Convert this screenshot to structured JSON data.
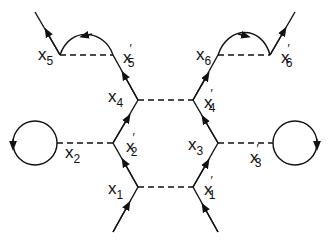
{
  "diagram": {
    "colors": {
      "stroke": "#111111",
      "background": "#ffffff"
    },
    "labels": {
      "x1": {
        "base": "x",
        "sub": "1",
        "prime": ""
      },
      "x1p": {
        "base": "x",
        "sub": "1",
        "prime": "′"
      },
      "x2": {
        "base": "x",
        "sub": "2",
        "prime": ""
      },
      "x2p": {
        "base": "x",
        "sub": "2",
        "prime": "′"
      },
      "x3": {
        "base": "x",
        "sub": "3",
        "prime": ""
      },
      "x3p": {
        "base": "x",
        "sub": "3",
        "prime": "′"
      },
      "x4": {
        "base": "x",
        "sub": "4",
        "prime": ""
      },
      "x4p": {
        "base": "x",
        "sub": "4",
        "prime": "′"
      },
      "x5": {
        "base": "x",
        "sub": "5",
        "prime": ""
      },
      "x5p": {
        "base": "x",
        "sub": "5",
        "prime": "′"
      },
      "x6": {
        "base": "x",
        "sub": "6",
        "prime": ""
      },
      "x6p": {
        "base": "x",
        "sub": "6",
        "prime": "′"
      }
    }
  }
}
